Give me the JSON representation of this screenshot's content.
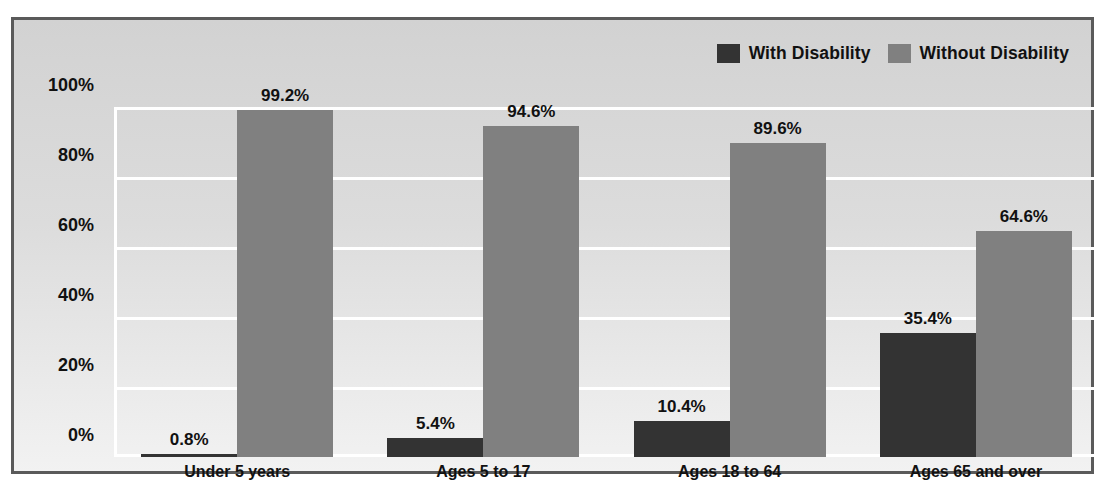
{
  "chart_data": {
    "type": "bar",
    "title": "",
    "subtitle": "",
    "xlabel": "",
    "ylabel": "",
    "ylim": [
      0,
      100
    ],
    "ytick_labels": [
      "0%",
      "20%",
      "40%",
      "60%",
      "80%",
      "100%"
    ],
    "ytick_values": [
      0,
      20,
      40,
      60,
      80,
      100
    ],
    "grid": true,
    "legend_position": "top-right",
    "categories": [
      "Under 5 years",
      "Ages 5 to 17",
      "Ages 18 to 64",
      "Ages 65 and over"
    ],
    "series": [
      {
        "name": "With Disability",
        "color": "#333333",
        "values": [
          0.8,
          5.4,
          10.4,
          35.4
        ],
        "labels": [
          "0.8%",
          "5.4%",
          "10.4%",
          "35.4%"
        ]
      },
      {
        "name": "Without Disability",
        "color": "#808080",
        "values": [
          99.2,
          94.6,
          89.6,
          64.6
        ],
        "labels": [
          "99.2%",
          "94.6%",
          "89.6%",
          "64.6%"
        ]
      }
    ]
  },
  "legend": {
    "items": [
      {
        "label": "With Disability",
        "swatch": "legend-swatch-dark"
      },
      {
        "label": "Without Disability",
        "swatch": "legend-swatch-light"
      }
    ]
  },
  "axis": {
    "y": {
      "ticks": [
        {
          "label": "100%"
        },
        {
          "label": "80%"
        },
        {
          "label": "60%"
        },
        {
          "label": "40%"
        },
        {
          "label": "20%"
        },
        {
          "label": "0%"
        }
      ]
    },
    "x": {
      "ticks": [
        {
          "label": "Under 5 years"
        },
        {
          "label": "Ages 5 to 17"
        },
        {
          "label": "Ages 18 to 64"
        },
        {
          "label": "Ages 65 and over"
        }
      ]
    }
  },
  "colors": {
    "with_disability": "#333333",
    "without_disability": "#808080",
    "gridline": "#ffffff",
    "panel_border": "#5a5a5a",
    "text": "#111111"
  }
}
